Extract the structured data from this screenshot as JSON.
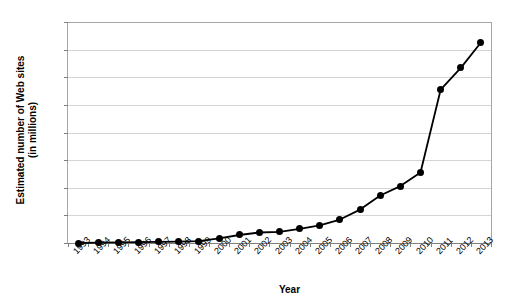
{
  "chart_data": {
    "type": "line",
    "title": "",
    "xlabel": "Year",
    "ylabel": "Estimated number of Web sites (in millions)",
    "ylabel_line1": "Estimated number of Web sites",
    "ylabel_line2": "(in millions)",
    "ylim": [
      0,
      800
    ],
    "ytick_step": 100,
    "grid": true,
    "legend": "none",
    "marker": "filled-circle",
    "line_color": "#000000",
    "marker_color": "#000000",
    "gridline_color": "#d4d4d4",
    "categories": [
      "1993",
      "1994",
      "1995",
      "1996",
      "1997",
      "1998",
      "1999",
      "2000",
      "2001",
      "2002",
      "2003",
      "2004",
      "2005",
      "2006",
      "2007",
      "2008",
      "2009",
      "2010",
      "2011",
      "2012",
      "2013"
    ],
    "values": [
      0,
      1,
      2,
      3,
      4,
      5,
      7,
      17,
      29,
      38,
      40,
      51,
      64,
      85,
      121,
      172,
      206,
      255,
      555,
      634,
      726
    ],
    "ytick_labels": [
      "0",
      "100",
      "200",
      "300",
      "400",
      "500",
      "600",
      "700",
      "800"
    ]
  },
  "axis": {
    "y_title_line1": "Estimated number of Web sites",
    "y_title_line2": "(in millions)",
    "x_title": "Year"
  }
}
